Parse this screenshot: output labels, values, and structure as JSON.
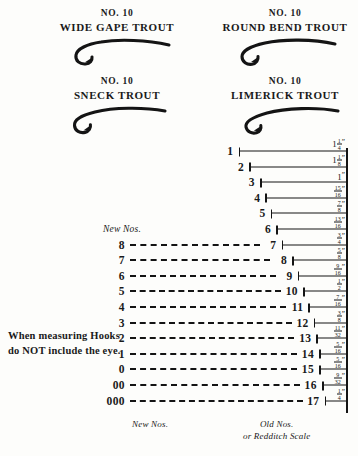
{
  "specimens": [
    {
      "no_label": "NO. 10",
      "name": "WIDE GAPE TROUT",
      "icon": "fish-hook-icon"
    },
    {
      "no_label": "NO. 10",
      "name": "ROUND BEND TROUT",
      "icon": "fish-hook-icon"
    },
    {
      "no_label": "NO. 10",
      "name": "SNECK TROUT",
      "icon": "fish-hook-icon"
    },
    {
      "no_label": "NO. 10",
      "name": "LIMERICK TROUT",
      "icon": "fish-hook-icon"
    }
  ],
  "caption": {
    "line1": "When measuring Hooks",
    "line2": "do NOT include the eye."
  },
  "headers": {
    "new_top": "New Nos.",
    "new_bottom": "New Nos.",
    "old_bottom_line1": "Old Nos.",
    "old_bottom_line2": "or Redditch Scale"
  },
  "chart_data": {
    "type": "bar",
    "xlabel": "Hook length (inches)",
    "ylabel": "Hook size number",
    "orientation": "horizontal",
    "grid": false,
    "legend": null,
    "categories": [
      "1",
      "2",
      "3",
      "4",
      "5",
      "6",
      "7",
      "8",
      "9",
      "10",
      "11",
      "12",
      "13",
      "14",
      "15",
      "16",
      "17"
    ],
    "values": [
      1.25,
      1.125,
      1.0,
      0.9375,
      0.875,
      0.8125,
      0.75,
      0.625,
      0.5625,
      0.5,
      0.4375,
      0.375,
      0.34375,
      0.3125,
      0.3125,
      0.28125,
      0.25
    ],
    "value_labels": [
      {
        "whole": "1",
        "num": "1",
        "den": "4",
        "unit": "″"
      },
      {
        "whole": "1",
        "num": "1",
        "den": "8",
        "unit": "″"
      },
      {
        "whole": "1",
        "num": "",
        "den": "",
        "unit": "″"
      },
      {
        "whole": "",
        "num": "15",
        "den": "16",
        "unit": "″"
      },
      {
        "whole": "",
        "num": "7",
        "den": "8",
        "unit": "″"
      },
      {
        "whole": "",
        "num": "13",
        "den": "16",
        "unit": "″"
      },
      {
        "whole": "",
        "num": "3",
        "den": "4",
        "unit": "″"
      },
      {
        "whole": "",
        "num": "5",
        "den": "8",
        "unit": "″"
      },
      {
        "whole": "",
        "num": "9",
        "den": "16",
        "unit": "″"
      },
      {
        "whole": "",
        "num": "1",
        "den": "2",
        "unit": "″"
      },
      {
        "whole": "",
        "num": "7",
        "den": "16",
        "unit": "″"
      },
      {
        "whole": "",
        "num": "3",
        "den": "8",
        "unit": "″"
      },
      {
        "whole": "",
        "num": "11",
        "den": "32",
        "unit": "″"
      },
      {
        "whole": "",
        "num": "5",
        "den": "16",
        "unit": "″"
      },
      {
        "whole": "",
        "num": "5",
        "den": "16",
        "unit": "″"
      },
      {
        "whole": "",
        "num": "9",
        "den": "32",
        "unit": "″"
      },
      {
        "whole": "",
        "num": "1",
        "den": "4",
        "unit": "″"
      }
    ],
    "series": [
      {
        "name": "New Nos.",
        "style": "dashed",
        "labels": [
          "8",
          "7",
          "6",
          "5",
          "4",
          "3",
          "2",
          "1",
          "0",
          "00",
          "000"
        ],
        "aligned_old_nos": [
          "7",
          "8",
          "9",
          "10",
          "11",
          "12",
          "13",
          "14",
          "15",
          "16",
          "17"
        ]
      }
    ]
  }
}
